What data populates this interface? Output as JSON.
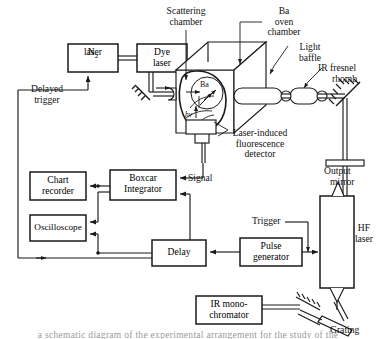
{
  "figure": {
    "type": "apparatus-schematic",
    "background_color": "#ffffff",
    "line_color": "#1a1a1a",
    "caption_fragment": "a schematic diagram of the experimental arrangement for the study of the"
  },
  "boxes": {
    "n2_laser": {
      "label_line1": "N₂",
      "label_line2": "laser"
    },
    "dye_laser": {
      "label_line1": "Dye",
      "label_line2": "laser"
    },
    "chart_recorder": {
      "label_line1": "Chart",
      "label_line2": "recorder"
    },
    "oscilloscope": {
      "label_line1": "Oscilloscope",
      "label_line2": ""
    },
    "boxcar_integrator": {
      "label_line1": "Boxcar",
      "label_line2": "Integrator"
    },
    "delay": {
      "label_line1": "Delay",
      "label_line2": ""
    },
    "pulse_generator": {
      "label_line1": "Pulse",
      "label_line2": "generator"
    },
    "hf_laser": {
      "label_line1": "HF",
      "label_line2": "laser"
    },
    "ir_monochromator": {
      "label_line1": "IR mono-",
      "label_line2": "chromator"
    }
  },
  "annotations": {
    "scattering_chamber": {
      "line1": "Scattering",
      "line2": "chamber"
    },
    "ba_oven_chamber": {
      "line1": "Ba",
      "line2": "oven",
      "line3": "chamber"
    },
    "light_baffle": {
      "line1": "Light",
      "line2": "baffle"
    },
    "ir_fresnel_rhomb": {
      "line1": "IR fresnel",
      "line2": "rhomb"
    },
    "output_mirror": {
      "line1": "Output",
      "line2": "mirror"
    },
    "lif_detector": {
      "line1": "Laser-induced",
      "line2": "fluorescence",
      "line3": "detector"
    },
    "delayed_trigger": {
      "line1": "Delayed",
      "line2": "trigger"
    },
    "signal": {
      "line1": "Signal"
    },
    "trigger": {
      "line1": "Trigger"
    },
    "grating": {
      "line1": "Grating"
    },
    "ba_species": {
      "line1": "Ba"
    },
    "photon": {
      "line1": "hν"
    }
  }
}
